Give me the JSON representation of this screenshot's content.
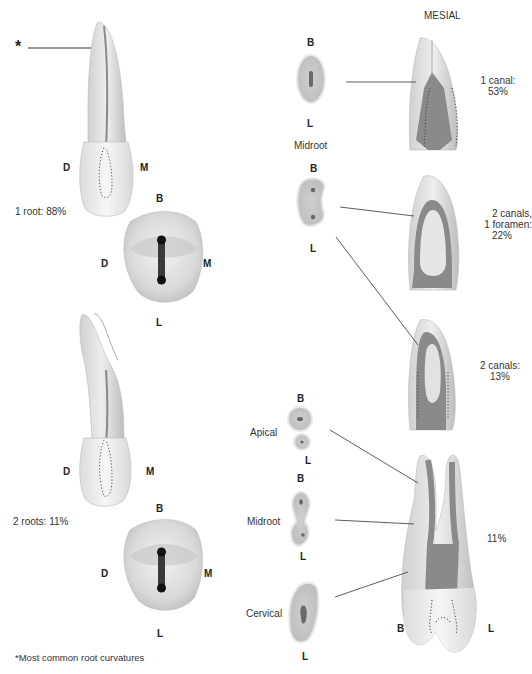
{
  "figure": {
    "left_panel": {
      "asterisk": "*",
      "tooth1": {
        "label_d": "D",
        "label_m": "M",
        "caption": "1 root: 88%"
      },
      "occlusal1": {
        "label_b": "B",
        "label_d": "D",
        "label_m": "M",
        "label_l": "L"
      },
      "tooth2": {
        "label_d": "D",
        "label_m": "M",
        "caption": "2 roots: 11%"
      },
      "occlusal2": {
        "label_b": "B",
        "label_d": "D",
        "label_m": "M",
        "label_l": "L"
      },
      "footnote": "*Most common root curvatures"
    },
    "right_panel": {
      "header": "MESIAL",
      "section1": {
        "label_b": "B",
        "label_l": "L",
        "level": "Midroot"
      },
      "section2": {
        "label_b": "B",
        "label_l": "L"
      },
      "mesial1": {
        "caption_line1": "1 canal:",
        "caption_line2": "53%"
      },
      "mesial2": {
        "caption_line1": "2 canals,",
        "caption_line2": "1 foramen:",
        "caption_line3": "22%"
      },
      "mesial3": {
        "caption_line1": "2 canals:",
        "caption_line2": "13%"
      },
      "mesial4": {
        "caption": "11%",
        "label_b": "B",
        "label_l": "L"
      },
      "apical": {
        "label_b": "B",
        "label_l": "L",
        "level": "Apical"
      },
      "midroot2": {
        "label_b": "B",
        "label_l": "L",
        "level": "Midroot"
      },
      "cervical": {
        "label_b": "B",
        "label_l": "L",
        "level": "Cervical"
      }
    },
    "colors": {
      "pulp": "#8a8a8a",
      "dentin": "#d4d4d4",
      "enamel": "#ededed",
      "line": "#333333"
    }
  }
}
